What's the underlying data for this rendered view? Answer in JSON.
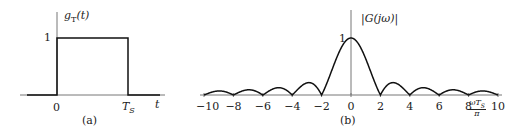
{
  "figure_a": {
    "ylabel": "g",
    "ylabel_sub": "T",
    "ylabel_arg": "(t)",
    "y_tick": "1",
    "x_ticks": [
      "0",
      "T"
    ],
    "x_tick_sub": "S",
    "xlabel": "t",
    "caption": "(a)"
  },
  "figure_b": {
    "ylabel": "|G(jω)|",
    "y_tick": "1",
    "x_ticks": [
      "−10",
      "−8",
      "−6",
      "−4",
      "−2",
      "0",
      "2",
      "4",
      "6",
      "8",
      "10"
    ],
    "xlabel_num": "ωT",
    "xlabel_sub": "S",
    "xlabel_den": "π",
    "caption": "(b)"
  },
  "chart_data": [
    {
      "type": "line",
      "title": "g_T(t)",
      "xlabel": "t",
      "ylabel": "g_T(t)",
      "x": [
        "-",
        "0",
        "0",
        "T_S",
        "T_S",
        "+"
      ],
      "values": [
        0,
        0,
        1,
        1,
        0,
        0
      ],
      "ylim": [
        0,
        1
      ],
      "grid": false
    },
    {
      "type": "line",
      "title": "|G(jω)|",
      "xlabel": "ωT_S/π",
      "ylabel": "|G(jω)|",
      "function": "|sinc(x/2)|",
      "x": [
        -10,
        -9,
        -8,
        -7,
        -6,
        -5,
        -4,
        -3,
        -2,
        -1,
        0,
        1,
        2,
        3,
        4,
        5,
        6,
        7,
        8,
        9,
        10
      ],
      "values": [
        0,
        0.071,
        0,
        0.091,
        0,
        0.127,
        0,
        0.212,
        0,
        0.637,
        1,
        0.637,
        0,
        0.212,
        0,
        0.127,
        0,
        0.091,
        0,
        0.071,
        0
      ],
      "xlim": [
        -10,
        10
      ],
      "ylim": [
        0,
        1
      ],
      "grid": false
    }
  ]
}
